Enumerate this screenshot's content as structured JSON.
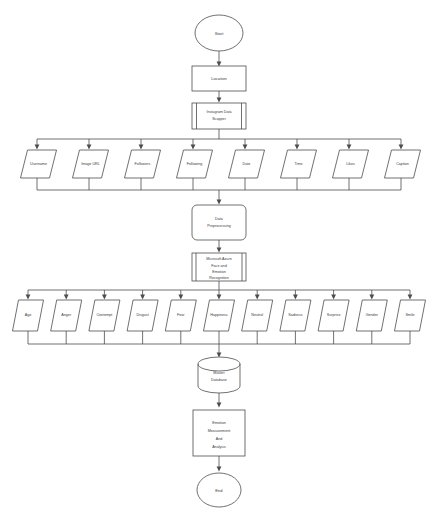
{
  "diagram": {
    "background_color": "#ffffff",
    "line_color": "#4d4d4d",
    "text_color": "#3a3a3a"
  },
  "nodes": {
    "start": {
      "label": "Start",
      "shape": "ellipse"
    },
    "location": {
      "label": "Location",
      "shape": "rectangle"
    },
    "scraper": {
      "label_line1": "Instagram Data",
      "label_line2": "Scapper",
      "shape": "predefined-process"
    },
    "preprocessing": {
      "label_line1": "Data",
      "label_line2": "Preprocessing",
      "shape": "rounded-rectangle"
    },
    "azure": {
      "label_line1": "Microsoft Azure",
      "label_line2": "Face and",
      "label_line3": "Emotion",
      "label_line4": "Recognition",
      "shape": "predefined-process"
    },
    "master_database": {
      "label_line1": "Master",
      "label_line2": "Database",
      "shape": "cylinder"
    },
    "analysis": {
      "label_line1": "Emotion",
      "label_line2": "Measurement",
      "label_line3": "And",
      "label_line4": "Analysis",
      "shape": "rectangle"
    },
    "end": {
      "label": "End",
      "shape": "ellipse"
    }
  },
  "scraped_fields": {
    "shape": "parallelogram",
    "items": [
      {
        "label": "Username"
      },
      {
        "label": "Image URL"
      },
      {
        "label": "Followers"
      },
      {
        "label": "Following"
      },
      {
        "label": "Date"
      },
      {
        "label": "Time"
      },
      {
        "label": "Likes"
      },
      {
        "label": "Caption"
      }
    ]
  },
  "recognition_outputs": {
    "shape": "parallelogram",
    "items": [
      {
        "label": "Age"
      },
      {
        "label": "Anger"
      },
      {
        "label": "Contempt"
      },
      {
        "label": "Disgust"
      },
      {
        "label": "Fear"
      },
      {
        "label": "Happiness"
      },
      {
        "label": "Neutral"
      },
      {
        "label": "Sadness"
      },
      {
        "label": "Surprise"
      },
      {
        "label": "Gender"
      },
      {
        "label": "Smile"
      }
    ]
  }
}
